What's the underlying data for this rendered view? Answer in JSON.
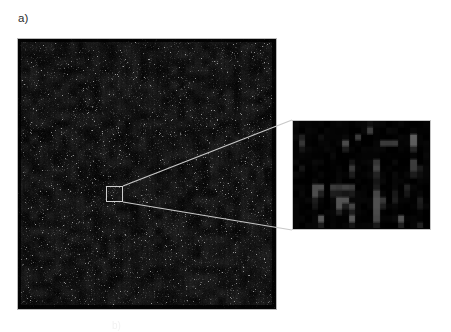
{
  "figure": {
    "panel_label": "a)",
    "background_color": "#ffffff",
    "bottom_caption_partial": "b)",
    "main_image": {
      "name": "dark-noise-field",
      "frame_border_color": "#b9b9b9",
      "background_color": "#050505",
      "x": 17,
      "y": 38,
      "width": 260,
      "height": 272,
      "description": "dark speckled noise field"
    },
    "selection_box": {
      "name": "zoom-selection-box",
      "border_color": "#cfcfcf",
      "x": 106,
      "y": 186,
      "width": 17,
      "height": 16
    },
    "connectors": {
      "name": "magnifier-leader-lines",
      "color": "#c9c9c9",
      "width": 1.2,
      "lines": [
        {
          "x1": 123,
          "y1": 186,
          "x2": 292,
          "y2": 120
        },
        {
          "x1": 123,
          "y1": 202,
          "x2": 292,
          "y2": 230
        }
      ]
    },
    "inset_image": {
      "name": "magnified-detail",
      "frame_border_color": "#c6c6c6",
      "background_color": "#040404",
      "x": 292,
      "y": 120,
      "width": 139,
      "height": 110,
      "description": "blocky magnified pixels of the selected region"
    }
  },
  "chart_data": {
    "type": "heatmap",
    "title": "a)",
    "xlabel": "",
    "ylabel": "",
    "grid": false,
    "legend": "none",
    "colormap": "grayscale",
    "value_range": [
      0,
      255
    ],
    "panels": [
      {
        "name": "main-noise-field",
        "type": "heatmap",
        "cols": 130,
        "rows": 136,
        "note": "Dense low-amplitude grayscale noise; mean intensity near 12/255 with sparse bright speckles up to ~140/255.",
        "stats": {
          "mean": 12,
          "median": 8,
          "max": 150,
          "min": 0
        }
      },
      {
        "name": "magnified-detail",
        "type": "heatmap",
        "cols": 22,
        "rows": 17,
        "note": "Upsampled 22x17 block of the selected region rendered as discrete pixels.",
        "values": [
          [
            6,
            4,
            3,
            8,
            5,
            4,
            3,
            10,
            6,
            4,
            3,
            5,
            22,
            6,
            4,
            3,
            7,
            5,
            4,
            3,
            6,
            4
          ],
          [
            4,
            3,
            5,
            4,
            3,
            6,
            4,
            3,
            5,
            4,
            3,
            4,
            60,
            4,
            3,
            5,
            4,
            3,
            6,
            4,
            3,
            5
          ],
          [
            8,
            30,
            5,
            4,
            20,
            6,
            4,
            3,
            5,
            4,
            60,
            4,
            3,
            5,
            4,
            3,
            5,
            4,
            3,
            95,
            6,
            4
          ],
          [
            5,
            55,
            6,
            4,
            3,
            5,
            4,
            3,
            70,
            5,
            4,
            3,
            5,
            4,
            62,
            58,
            60,
            4,
            3,
            88,
            5,
            4
          ],
          [
            4,
            22,
            5,
            4,
            3,
            6,
            4,
            3,
            30,
            4,
            3,
            5,
            4,
            3,
            5,
            4,
            3,
            5,
            4,
            35,
            4,
            3
          ],
          [
            6,
            4,
            3,
            5,
            4,
            3,
            6,
            4,
            3,
            5,
            4,
            3,
            5,
            4,
            3,
            5,
            4,
            3,
            6,
            4,
            3,
            5
          ],
          [
            5,
            4,
            3,
            6,
            4,
            3,
            5,
            4,
            3,
            20,
            4,
            3,
            6,
            55,
            4,
            3,
            5,
            4,
            3,
            58,
            4,
            3
          ],
          [
            4,
            18,
            3,
            5,
            4,
            3,
            6,
            4,
            3,
            60,
            4,
            3,
            5,
            62,
            4,
            3,
            5,
            4,
            3,
            62,
            30,
            3
          ],
          [
            6,
            4,
            3,
            5,
            4,
            3,
            5,
            4,
            3,
            24,
            4,
            3,
            5,
            30,
            4,
            3,
            5,
            4,
            3,
            30,
            12,
            3
          ],
          [
            5,
            4,
            3,
            5,
            4,
            3,
            6,
            4,
            3,
            5,
            4,
            3,
            5,
            26,
            4,
            3,
            6,
            4,
            3,
            5,
            4,
            3
          ],
          [
            4,
            3,
            5,
            80,
            75,
            4,
            60,
            58,
            62,
            55,
            4,
            3,
            5,
            30,
            4,
            3,
            5,
            4,
            30,
            5,
            4,
            3
          ],
          [
            3,
            5,
            4,
            78,
            30,
            4,
            28,
            30,
            26,
            22,
            4,
            3,
            5,
            72,
            4,
            3,
            28,
            4,
            24,
            5,
            4,
            3
          ],
          [
            4,
            3,
            5,
            30,
            4,
            3,
            5,
            85,
            82,
            4,
            3,
            5,
            4,
            80,
            60,
            4,
            25,
            4,
            3,
            5,
            30,
            3
          ],
          [
            3,
            5,
            4,
            26,
            4,
            3,
            5,
            88,
            30,
            70,
            4,
            3,
            5,
            78,
            26,
            4,
            5,
            4,
            3,
            5,
            26,
            3
          ],
          [
            4,
            3,
            5,
            4,
            3,
            5,
            4,
            30,
            4,
            26,
            4,
            3,
            5,
            72,
            4,
            3,
            5,
            4,
            3,
            5,
            4,
            3
          ],
          [
            3,
            5,
            4,
            3,
            90,
            4,
            3,
            5,
            4,
            85,
            4,
            3,
            5,
            65,
            4,
            3,
            5,
            80,
            4,
            3,
            5,
            4
          ],
          [
            4,
            3,
            5,
            4,
            30,
            4,
            3,
            5,
            4,
            26,
            4,
            3,
            5,
            30,
            4,
            3,
            5,
            28,
            4,
            3,
            30,
            4
          ]
        ]
      }
    ]
  }
}
